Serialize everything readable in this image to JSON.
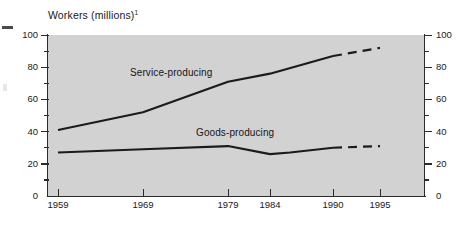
{
  "chart_data": {
    "type": "line",
    "title": "Workers (millions)",
    "title_superscript": "1",
    "xlabel": "",
    "ylabel": "",
    "ylim": [
      0,
      100
    ],
    "ytick_labels": [
      "0",
      "20",
      "40",
      "60",
      "80",
      "100"
    ],
    "ytick_values": [
      0,
      20,
      40,
      60,
      80,
      100
    ],
    "yminor_values": [
      10,
      30,
      50,
      70,
      90
    ],
    "right_axis_labels": [
      "0",
      "20",
      "40",
      "60",
      "80",
      "100"
    ],
    "categories": [
      "1959",
      "1969",
      "1979",
      "1984",
      "1990",
      "1995"
    ],
    "grid": false,
    "legend_position": "inline-annotations",
    "series": [
      {
        "name": "Service-producing",
        "values": [
          41,
          52,
          71,
          76,
          87,
          92
        ],
        "solid_through": "1990",
        "projected_from": "1990",
        "style": "solid-then-dashed"
      },
      {
        "name": "Goods-producing",
        "values": [
          27,
          29,
          31,
          26,
          30,
          31
        ],
        "solid_through": "1990",
        "projected_from": "1990",
        "style": "solid-then-dashed"
      }
    ]
  },
  "axis": {
    "y_left": {
      "labels": [
        "100",
        "80",
        "60",
        "40",
        "20",
        "0"
      ]
    },
    "y_right": {
      "labels": [
        "100",
        "80",
        "60",
        "40",
        "20",
        "0"
      ]
    },
    "x": {
      "labels": [
        "1959",
        "1969",
        "1979",
        "1984",
        "1990",
        "1995"
      ]
    }
  },
  "labels": {
    "service": "Service-producing",
    "goods": "Goods-producing"
  },
  "colors": {
    "plot_background": "#d2d2d2",
    "line": "#1b1b1b",
    "axis": "#2b2b2b",
    "page_background": "#ffffff",
    "text": "#1a1a1a"
  }
}
